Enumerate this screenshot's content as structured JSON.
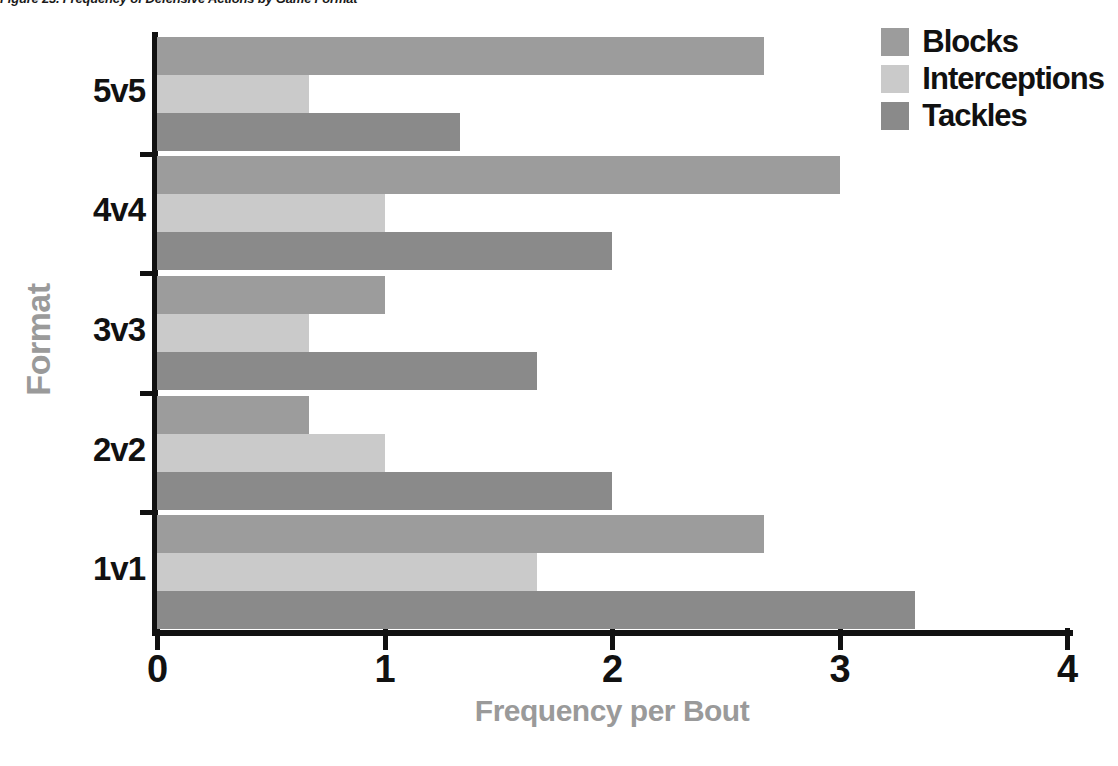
{
  "caption": "Figure 23. Frequency of Defensive Actions by Game Format",
  "chart_data": {
    "type": "bar",
    "orientation": "horizontal",
    "title": "Figure 23. Frequency of Defensive Actions by Game Format",
    "xlabel": "Frequency per Bout",
    "ylabel": "Format",
    "categories": [
      "1v1",
      "2v2",
      "3v3",
      "4v4",
      "5v5"
    ],
    "xlim": [
      0,
      4
    ],
    "xticks": [
      0,
      1,
      2,
      3,
      4
    ],
    "xticklabels": [
      "0",
      "1",
      "2",
      "3",
      "4"
    ],
    "grid": false,
    "legend_position": "top-right",
    "series": [
      {
        "name": "Blocks",
        "color": "#9c9c9c",
        "values": [
          2.67,
          0.67,
          1.0,
          3.0,
          2.67
        ]
      },
      {
        "name": "Interceptions",
        "color": "#cacaca",
        "values": [
          1.67,
          1.0,
          0.67,
          1.0,
          0.67
        ]
      },
      {
        "name": "Tackles",
        "color": "#8a8a8a",
        "values": [
          3.33,
          2.0,
          1.67,
          2.0,
          1.33
        ]
      }
    ]
  },
  "legend": {
    "items": [
      {
        "label": "Blocks",
        "color": "#9c9c9c"
      },
      {
        "label": "Interceptions",
        "color": "#cacaca"
      },
      {
        "label": "Tackles",
        "color": "#8a8a8a"
      }
    ]
  },
  "axes": {
    "x_title": "Frequency per Bout",
    "y_title": "Format",
    "x_tick_labels": [
      "0",
      "1",
      "2",
      "3",
      "4"
    ],
    "y_tick_labels": [
      "5v5",
      "4v4",
      "3v3",
      "2v2",
      "1v1"
    ]
  },
  "colors": {
    "axis": "#111111",
    "axis_title": "#9a9a9a",
    "background": "#ffffff"
  }
}
